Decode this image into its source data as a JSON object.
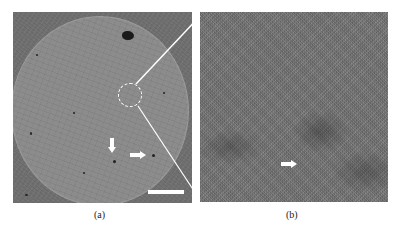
{
  "figure": {
    "panels": [
      {
        "id": "a",
        "caption": "(a)",
        "description": "Low-magnification micrograph of a circular disc specimen with a dashed circle marking a zoomed region",
        "annotations": [
          "dashed-circle-region",
          "arrow-down",
          "arrow-right",
          "scale-bar"
        ]
      },
      {
        "id": "b",
        "caption": "(b)",
        "description": "High-magnification view of the dashed-circle region showing fine granular texture",
        "annotations": [
          "arrow-right"
        ]
      }
    ],
    "colors": {
      "background": "#ffffff",
      "annotation": "#ffffff",
      "specimen": "#8c8c8c",
      "surround": "#6f6f6f"
    }
  }
}
